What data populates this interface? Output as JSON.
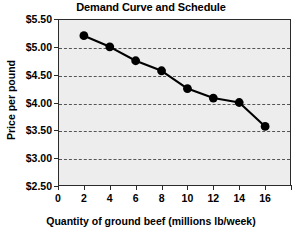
{
  "chart_data": {
    "type": "line",
    "title": "Demand Curve and Schedule",
    "xlabel": "Quantity of ground beef (millions lb/week)",
    "ylabel": "Price per pound",
    "x": [
      2,
      4,
      6,
      8,
      10,
      12,
      14,
      16
    ],
    "values": [
      5.2,
      5.0,
      4.75,
      4.57,
      4.25,
      4.08,
      4.0,
      3.57
    ],
    "series": [
      {
        "name": "Demand",
        "values": [
          5.2,
          5.0,
          4.75,
          4.57,
          4.25,
          4.08,
          4.0,
          3.57
        ]
      }
    ],
    "xlim": [
      0,
      18
    ],
    "ylim": [
      2.5,
      5.5
    ],
    "xticks": [
      0,
      2,
      4,
      6,
      8,
      10,
      12,
      14,
      16,
      18
    ],
    "xtick_labels": [
      "0",
      "2",
      "4",
      "6",
      "8",
      "10",
      "12",
      "14",
      "16",
      ""
    ],
    "yticks": [
      2.5,
      3.0,
      3.5,
      4.0,
      4.5,
      5.0,
      5.5
    ],
    "ytick_labels": [
      "$2.50",
      "$3.00",
      "$3.50",
      "$4.00",
      "$4.50",
      "$5.00",
      "$5.50"
    ],
    "grid": true,
    "grid_axis": "y",
    "grid_style": "dashed",
    "legend": false,
    "marker": "circle",
    "marker_color": "#000000",
    "line_color": "#000000",
    "plot_background": "#ededed",
    "figure_background": "#ffffff"
  }
}
